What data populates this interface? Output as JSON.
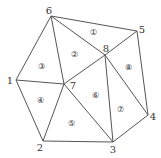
{
  "diagram": {
    "type": "triangulated-polygon-mesh",
    "line_color": "#555555",
    "text_color": "#333333",
    "nodes": [
      {
        "id": "1",
        "label": "1",
        "x": 16,
        "y": 80,
        "lx": 10,
        "ly": 84
      },
      {
        "id": "2",
        "label": "2",
        "x": 43,
        "y": 141,
        "lx": 40,
        "ly": 151
      },
      {
        "id": "3",
        "label": "3",
        "x": 113,
        "y": 142,
        "lx": 113,
        "ly": 153
      },
      {
        "id": "4",
        "label": "4",
        "x": 148,
        "y": 115,
        "lx": 153,
        "ly": 120
      },
      {
        "id": "5",
        "label": "5",
        "x": 137,
        "y": 31,
        "lx": 142,
        "ly": 33
      },
      {
        "id": "6",
        "label": "6",
        "x": 51,
        "y": 16,
        "lx": 49,
        "ly": 14
      },
      {
        "id": "7",
        "label": "7",
        "x": 64,
        "y": 84,
        "lx": 73,
        "ly": 89
      },
      {
        "id": "8",
        "label": "8",
        "x": 105,
        "y": 55,
        "lx": 106,
        "ly": 52
      }
    ],
    "edges": [
      [
        "6",
        "5"
      ],
      [
        "5",
        "4"
      ],
      [
        "4",
        "3"
      ],
      [
        "3",
        "2"
      ],
      [
        "2",
        "1"
      ],
      [
        "1",
        "6"
      ],
      [
        "6",
        "7"
      ],
      [
        "6",
        "8"
      ],
      [
        "1",
        "7"
      ],
      [
        "2",
        "7"
      ],
      [
        "7",
        "3"
      ],
      [
        "7",
        "8"
      ],
      [
        "8",
        "5"
      ],
      [
        "8",
        "3"
      ],
      [
        "8",
        "4"
      ]
    ],
    "regions": [
      {
        "label": "①",
        "x": 93,
        "y": 32
      },
      {
        "label": "②",
        "x": 74,
        "y": 54
      },
      {
        "label": "③",
        "x": 41,
        "y": 66
      },
      {
        "label": "④",
        "x": 40,
        "y": 100
      },
      {
        "label": "⑤",
        "x": 71,
        "y": 123
      },
      {
        "label": "⑥",
        "x": 95,
        "y": 95
      },
      {
        "label": "⑦",
        "x": 120,
        "y": 109
      },
      {
        "label": "⑧",
        "x": 128,
        "y": 67
      }
    ]
  }
}
